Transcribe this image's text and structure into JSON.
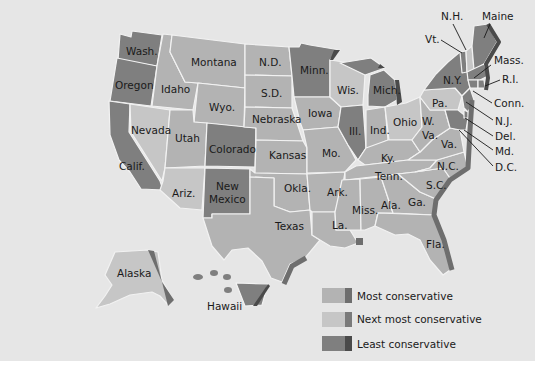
{
  "colors": {
    "background": "#e6e6e6",
    "most_conservative": "#b3b3b3",
    "next_most_conservative": "#c6c6c6",
    "least_conservative": "#7f7f7f",
    "shadow_most": "#6e6e6e",
    "shadow_next": "#7a7a7a",
    "shadow_least": "#4a4a4a"
  },
  "legend": {
    "items": [
      {
        "label": "Most conservative",
        "class": "most"
      },
      {
        "label": "Next most conservative",
        "class": "next"
      },
      {
        "label": "Least conservative",
        "class": "least"
      }
    ]
  },
  "states": {
    "wash": "Wash.",
    "oregon": "Oregon",
    "calif": "Calif.",
    "idaho": "Idaho",
    "nevada": "Nevada",
    "montana": "Montana",
    "wyo": "Wyo.",
    "utah": "Utah",
    "ariz": "Ariz.",
    "colorado": "Colorado",
    "new_mexico_1": "New",
    "new_mexico_2": "Mexico",
    "nd": "N.D.",
    "sd": "S.D.",
    "nebraska": "Nebraska",
    "kansas": "Kansas",
    "okla": "Okla.",
    "texas": "Texas",
    "minn": "Minn.",
    "iowa": "Iowa",
    "mo": "Mo.",
    "ark": "Ark.",
    "la": "La.",
    "wis": "Wis.",
    "ill": "Ill.",
    "mich": "Mich.",
    "ind": "Ind.",
    "ohio": "Ohio",
    "ky": "Ky.",
    "tenn": "Tenn.",
    "miss": "Miss.",
    "ala": "Ala.",
    "ga": "Ga.",
    "fla": "Fla.",
    "sc": "S.C.",
    "nc": "N.C.",
    "va": "Va.",
    "wva_1": "W.",
    "wva_2": "Va.",
    "pa": "Pa.",
    "ny": "N.Y.",
    "vt": "Vt.",
    "nh": "N.H.",
    "maine": "Maine",
    "mass": "Mass.",
    "ri": "R.I.",
    "conn": "Conn.",
    "nj": "N.J.",
    "del": "Del.",
    "md": "Md.",
    "dc": "D.C.",
    "alaska": "Alaska",
    "hawaii": "Hawaii"
  },
  "classification": {
    "least_conservative": [
      "Wash.",
      "Oregon",
      "Calif.",
      "Colorado",
      "New Mexico",
      "Minn.",
      "Mich.",
      "Ill.",
      "N.Y.",
      "Vt.",
      "Maine",
      "Mass.",
      "R.I.",
      "Conn.",
      "N.J.",
      "Del.",
      "Md.",
      "D.C.",
      "Hawaii"
    ],
    "most_conservative": [
      "Idaho",
      "Montana",
      "Wyo.",
      "Utah",
      "N.D.",
      "S.D.",
      "Nebraska",
      "Kansas",
      "Okla.",
      "Texas",
      "Mo.",
      "Ark.",
      "La.",
      "Miss.",
      "Ala.",
      "Ga.",
      "Fla.",
      "S.C.",
      "N.C.",
      "Tenn.",
      "Ky.",
      "Ind.",
      "Va.",
      "W. Va.",
      "Iowa"
    ],
    "next_most_conservative": [
      "Nevada",
      "Ariz.",
      "Wis.",
      "Ohio",
      "Pa.",
      "N.H.",
      "Alaska"
    ]
  }
}
